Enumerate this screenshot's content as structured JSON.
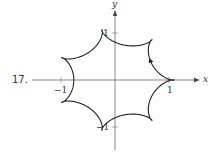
{
  "problem_number": "17.",
  "chart_data": {
    "type": "line",
    "title": "",
    "xlabel": "x",
    "ylabel": "y",
    "x_ticks": [
      {
        "value": -1,
        "label": "−1"
      },
      {
        "value": 1,
        "label": "1"
      }
    ],
    "y_ticks": [
      {
        "value": -1,
        "label": "−1"
      },
      {
        "value": 1,
        "label": "1"
      }
    ],
    "xlim": [
      -1.55,
      1.55
    ],
    "ylim": [
      -1.55,
      1.7
    ],
    "grid": false,
    "legend": null,
    "curve": {
      "kind": "parametric",
      "description": "closed curve with 7 outer lobes and 7 small inner loops, traced counterclockwise",
      "formula": "x = R(cos t + c cos 6t), y = R(sin t - c sin 6t)",
      "R": 0.93,
      "c": 0.18,
      "t_range": [
        0,
        6.2832
      ],
      "direction": "counterclockwise",
      "arrow_at_t": 0.5
    },
    "colors": {
      "curve": "#222222",
      "axes": "#555555"
    }
  }
}
